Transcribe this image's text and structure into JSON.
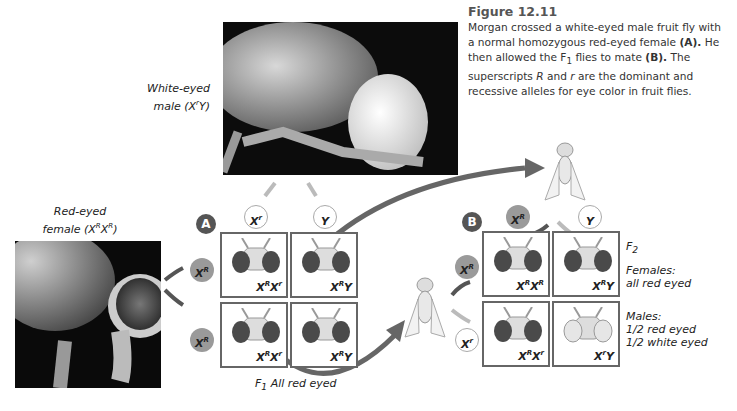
{
  "figure": {
    "title": "Figure 12.11",
    "caption_parts": {
      "p1": "Morgan crossed a white-eyed male fruit fly with a normal homozygous red-eyed female ",
      "a": "(A).",
      "p2": " He then allowed the F",
      "sub1": "1",
      "p3": " flies to mate ",
      "b": "(B).",
      "p4": " The superscripts ",
      "R": "R",
      "p5": " and ",
      "r": "r",
      "p6": " are the dominant and recessive alleles for eye color in fruit flies."
    }
  },
  "labels": {
    "white_male_line1": "White-eyed",
    "white_male_line2": "male (X",
    "white_male_sup": "r",
    "white_male_end": "Y)",
    "red_female_line1": "Red-eyed",
    "red_female_line2": "female (X",
    "red_female_sup1": "R",
    "red_female_mid": "X",
    "red_female_sup2": "R",
    "red_female_end": ")"
  },
  "cross_a": {
    "badge": "A",
    "male_gametes": [
      {
        "base": "X",
        "sup": "r"
      },
      {
        "base": "Y",
        "sup": ""
      }
    ],
    "female_gametes": [
      {
        "base": "X",
        "sup": "R"
      },
      {
        "base": "X",
        "sup": "R"
      }
    ],
    "cells": [
      {
        "g1": "X",
        "s1": "R",
        "g2": "X",
        "s2": "r",
        "eyes": "red"
      },
      {
        "g1": "X",
        "s1": "R",
        "g2": "Y",
        "s2": "",
        "eyes": "red"
      },
      {
        "g1": "X",
        "s1": "R",
        "g2": "X",
        "s2": "r",
        "eyes": "red"
      },
      {
        "g1": "X",
        "s1": "R",
        "g2": "Y",
        "s2": "",
        "eyes": "red"
      }
    ],
    "result_label": "F",
    "result_sub": "1",
    "result_text": " All red eyed"
  },
  "cross_b": {
    "badge": "B",
    "male_gametes": [
      {
        "base": "X",
        "sup": "R"
      },
      {
        "base": "Y",
        "sup": ""
      }
    ],
    "female_gametes": [
      {
        "base": "X",
        "sup": "R"
      },
      {
        "base": "X",
        "sup": "r"
      }
    ],
    "cells": [
      {
        "g1": "X",
        "s1": "R",
        "g2": "X",
        "s2": "R",
        "eyes": "red"
      },
      {
        "g1": "X",
        "s1": "R",
        "g2": "Y",
        "s2": "",
        "eyes": "red"
      },
      {
        "g1": "X",
        "s1": "R",
        "g2": "X",
        "s2": "r",
        "eyes": "red"
      },
      {
        "g1": "X",
        "s1": "r",
        "g2": "Y",
        "s2": "",
        "eyes": "white"
      }
    ],
    "generation": "F",
    "generation_sub": "2",
    "females_title": "Females:",
    "females_text": "all red eyed",
    "males_title": "Males:",
    "males_line1": "1/2 red eyed",
    "males_line2": "1/2 white eyed"
  },
  "colors": {
    "cell_border": "#666666",
    "dark_gamete": "#9a9a9a",
    "badge": "#555555",
    "arrow": "#555555",
    "red_eye": "#4a4a4a",
    "white_eye": "#e6e6e6"
  }
}
